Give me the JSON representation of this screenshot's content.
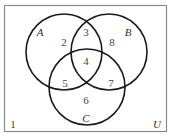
{
  "diagram": {
    "type": "venn",
    "universe_label": "U",
    "sets": [
      {
        "id": "A",
        "label": "A",
        "cx": 64,
        "cy": 52,
        "r": 38,
        "label_x": 40,
        "label_y": 36
      },
      {
        "id": "B",
        "label": "B",
        "cx": 109,
        "cy": 52,
        "r": 38,
        "label_x": 128,
        "label_y": 36
      },
      {
        "id": "C",
        "label": "C",
        "cx": 87,
        "cy": 87,
        "r": 38,
        "label_x": 86,
        "label_y": 122
      }
    ],
    "regions": [
      {
        "id": "outside",
        "label": "1",
        "x": 13,
        "y": 128
      },
      {
        "id": "A_only",
        "label": "2",
        "x": 64,
        "y": 46
      },
      {
        "id": "A_and_B_only",
        "label": "3",
        "x": 86,
        "y": 36
      },
      {
        "id": "A_and_B_and_C",
        "label": "4",
        "x": 86,
        "y": 65
      },
      {
        "id": "A_and_C_only",
        "label": "5",
        "x": 65,
        "y": 87
      },
      {
        "id": "C_only",
        "label": "6",
        "x": 86,
        "y": 104
      },
      {
        "id": "B_and_C_only",
        "label": "7",
        "x": 111,
        "y": 87
      },
      {
        "id": "B_only",
        "label": "8",
        "x": 112,
        "y": 46
      }
    ],
    "universe_label_pos": {
      "x": 157,
      "y": 128
    },
    "frame": {
      "x": 4.5,
      "y": 5.5,
      "width": 162,
      "height": 126
    },
    "colors": {
      "circle_stroke": "#1a1a1a",
      "frame_stroke": "#8a8a8a",
      "text": "#444444",
      "background": "#ffffff"
    }
  }
}
